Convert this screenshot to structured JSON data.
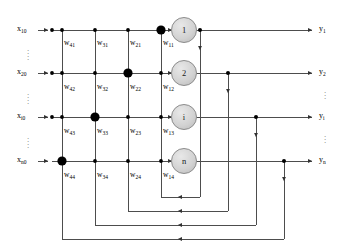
{
  "figure": {
    "type": "recurrent-neural-network-diagram",
    "background_color": "#ffffff",
    "line_color": "#4d4d4d",
    "node_color": "#000000",
    "neuron_fill": "#d4d4d4",
    "neuron_stroke": "#808080"
  },
  "inputs": [
    {
      "id": "x1",
      "label": "x",
      "sub": "10",
      "y": 30
    },
    {
      "id": "x2",
      "label": "x",
      "sub": "20",
      "y": 73
    },
    {
      "id": "x3",
      "label": "x",
      "sub": "i0",
      "y": 117
    },
    {
      "id": "x4",
      "label": "x",
      "sub": "n0",
      "y": 161
    }
  ],
  "neurons": [
    {
      "id": "n1",
      "label": "1",
      "y": 30
    },
    {
      "id": "n2",
      "label": "2",
      "y": 73
    },
    {
      "id": "n3",
      "label": "i",
      "y": 117
    },
    {
      "id": "n4",
      "label": "n",
      "y": 161
    }
  ],
  "outputs": [
    {
      "id": "y1",
      "label": "y",
      "sub": "1",
      "y": 30
    },
    {
      "id": "y2",
      "label": "y",
      "sub": "2",
      "y": 73
    },
    {
      "id": "y3",
      "label": "y",
      "sub": "i",
      "y": 117
    },
    {
      "id": "y4",
      "label": "y",
      "sub": "n",
      "y": 161
    }
  ],
  "weights": {
    "columns_x": [
      62,
      95,
      128,
      161
    ],
    "rows": [
      {
        "row": 1,
        "label_y": 44,
        "highlight_column": 4,
        "cells": [
          {
            "label": "w",
            "sub": "41"
          },
          {
            "label": "w",
            "sub": "31"
          },
          {
            "label": "w",
            "sub": "21"
          },
          {
            "label": "w",
            "sub": "11"
          }
        ]
      },
      {
        "row": 2,
        "label_y": 88,
        "highlight_column": 3,
        "cells": [
          {
            "label": "w",
            "sub": "42"
          },
          {
            "label": "w",
            "sub": "32"
          },
          {
            "label": "w",
            "sub": "22"
          },
          {
            "label": "w",
            "sub": "12"
          }
        ]
      },
      {
        "row": 3,
        "label_y": 132,
        "highlight_column": 2,
        "cells": [
          {
            "label": "w",
            "sub": "43"
          },
          {
            "label": "w",
            "sub": "33"
          },
          {
            "label": "w",
            "sub": "23"
          },
          {
            "label": "w",
            "sub": "13"
          }
        ]
      },
      {
        "row": 4,
        "label_y": 176,
        "highlight_column": 1,
        "cells": [
          {
            "label": "w",
            "sub": "44"
          },
          {
            "label": "w",
            "sub": "34"
          },
          {
            "label": "w",
            "sub": "24"
          },
          {
            "label": "w",
            "sub": "14"
          }
        ]
      }
    ]
  },
  "ellipsis": {
    "glyph": "."
  },
  "feedback": {
    "tap_x": [
      200,
      228,
      256,
      284
    ],
    "return_x": [
      161,
      128,
      95,
      62
    ],
    "bottom_y": [
      197,
      211,
      225,
      239
    ],
    "arrow_x": 178
  }
}
